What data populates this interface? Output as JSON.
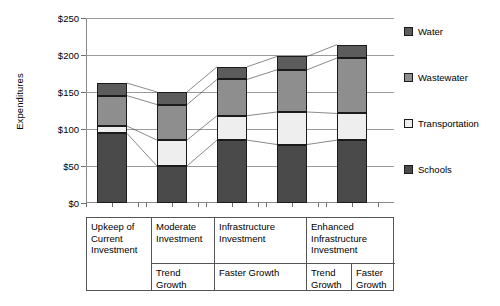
{
  "chart_data": {
    "type": "bar",
    "subtype": "stacked-column",
    "title": "",
    "xlabel": "",
    "ylabel": "Expenditures",
    "ylim": [
      0,
      250
    ],
    "ytick_labels": [
      "$0",
      "$50",
      "$100",
      "$150",
      "$200",
      "$250"
    ],
    "ytick_values": [
      0,
      50,
      100,
      150,
      200,
      250
    ],
    "grid": true,
    "grid_axis": "y",
    "legend_position": "right",
    "currency_prefix": "$",
    "categories": [
      "Upkeep of Current Investment",
      "Moderate Investment / Trend Growth",
      "Infrastructure Investment / Faster Growth",
      "Enhanced Infrastructure Investment / Trend Growth",
      "Enhanced Infrastructure Investment / Faster Growth"
    ],
    "series": [
      {
        "name": "Schools",
        "color": "#4a4a4a",
        "values": [
          94,
          50,
          85,
          79,
          85
        ]
      },
      {
        "name": "Transportation",
        "color": "#eeeeee",
        "values": [
          10,
          35,
          33,
          44,
          36
        ]
      },
      {
        "name": "Wastewater",
        "color": "#8e8e8e",
        "values": [
          41,
          48,
          49,
          57,
          75
        ]
      },
      {
        "name": "Water",
        "color": "#5c5c5c",
        "values": [
          17,
          17,
          17,
          18,
          18
        ]
      }
    ],
    "totals": [
      162,
      150,
      184,
      198,
      214
    ],
    "stack_order_bottom_to_top": [
      "Schools",
      "Transportation",
      "Wastewater",
      "Water"
    ]
  },
  "legend": {
    "items": [
      {
        "label": "Water",
        "color": "#5c5c5c"
      },
      {
        "label": "Wastewater",
        "color": "#8e8e8e"
      },
      {
        "label": "Transportation",
        "color": "#eeeeee"
      },
      {
        "label": "Schools",
        "color": "#4a4a4a"
      }
    ]
  },
  "scenario_table": {
    "top_row": [
      {
        "label": "Upkeep of Current Investment",
        "span_cols": 1,
        "span_rows": 2
      },
      {
        "label": "Moderate Investment",
        "span_cols": 1,
        "span_rows": 1
      },
      {
        "label": "Infrastructure Investment",
        "span_cols": 1,
        "span_rows": 1
      },
      {
        "label": "Enhanced Infrastructure Investment",
        "span_cols": 2,
        "span_rows": 1
      }
    ],
    "bottom_row": [
      {
        "label": "Trend Growth"
      },
      {
        "label": "Faster Growth"
      },
      {
        "label": "Trend Growth"
      },
      {
        "label": "Faster Growth"
      }
    ]
  }
}
